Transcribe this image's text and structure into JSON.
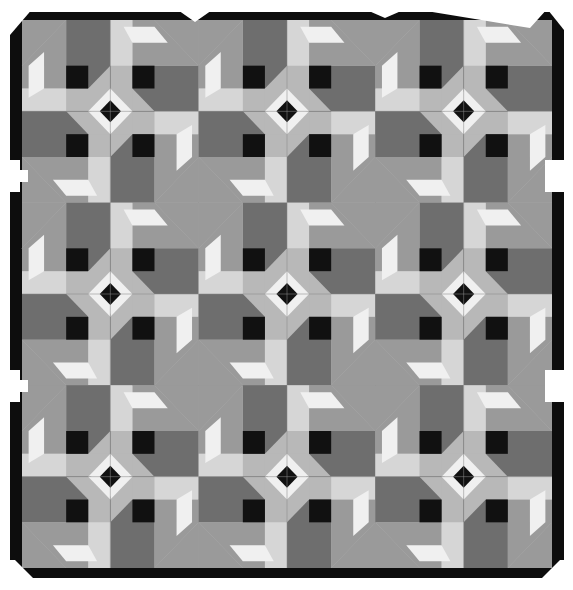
{
  "image": {
    "subject": "Grayscale photograph of a patchwork quilt with repeating pinwheel and diamond-center blocks",
    "pattern_name": "",
    "grid": {
      "rows": 3,
      "cols": 3
    },
    "block_features": [
      "center diamond on point",
      "four rotated arms",
      "speckled print triangles",
      "black corner squares"
    ]
  },
  "palette": {
    "background": "#ffffff",
    "border": "#0d0d0d",
    "black": "#111111",
    "dark": "#4a4a4a",
    "mid_dark": "#6e6e6e",
    "mid": "#9a9a9a",
    "light_mid": "#b8b8b8",
    "light": "#d6d6d6",
    "white": "#f0f0f0",
    "speckle_base": "#555555",
    "speckle_dot": "#bbbbbb"
  }
}
